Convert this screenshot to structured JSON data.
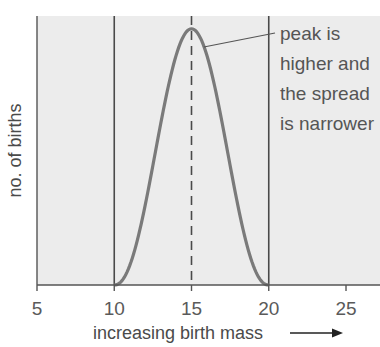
{
  "chart_data": {
    "type": "line",
    "title": "",
    "xlabel": "increasing birth mass",
    "xlabel_arrow": "→",
    "ylabel": "no. of births",
    "xlim": [
      5,
      27.2
    ],
    "ylim": [
      0,
      1.05
    ],
    "x_ticks": [
      5,
      10,
      15,
      20,
      25
    ],
    "x_tick_labels": [
      "5",
      "10",
      "15",
      "20",
      "25"
    ],
    "grid": false,
    "series": [
      {
        "name": "birth mass distribution",
        "distribution": "bell-shaped, symmetric",
        "x_range": [
          10,
          20
        ],
        "peak_x": 15,
        "peak_y": 1.0,
        "color": "#7a7a7a"
      }
    ],
    "reference_lines": [
      {
        "x": 10,
        "style": "solid"
      },
      {
        "x": 15,
        "style": "dashed"
      },
      {
        "x": 20,
        "style": "solid"
      }
    ],
    "annotation": {
      "lines": [
        "peak is",
        "higher and",
        "the spread",
        "is narrower"
      ],
      "points_to": {
        "x": 15.8,
        "y": 0.9
      }
    },
    "colors": {
      "plot_bg": "#ececec",
      "axis": "#555555",
      "ref_line": "#4a4a4a",
      "curve": "#7a7a7a"
    }
  }
}
